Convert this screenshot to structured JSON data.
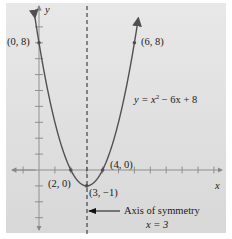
{
  "chart_data": {
    "type": "line",
    "title": "",
    "xlabel": "x",
    "ylabel": "y",
    "equation": "y = x² − 6x + 8",
    "equation_parts": {
      "lhs": "y = x",
      "exp": "2",
      "rhs": " − 6x + 8"
    },
    "x": [
      -0.2,
      0,
      1,
      2,
      3,
      4,
      5,
      6,
      6.2
    ],
    "series": [
      {
        "name": "y = x^2 - 6x + 8",
        "values": [
          9.24,
          8,
          3,
          0,
          -1,
          0,
          3,
          8,
          9.24
        ]
      }
    ],
    "points": [
      {
        "label": "(0, 8)",
        "x": 0,
        "y": 8
      },
      {
        "label": "(6, 8)",
        "x": 6,
        "y": 8
      },
      {
        "label": "(2, 0)",
        "x": 2,
        "y": 0
      },
      {
        "label": "(4, 0)",
        "x": 4,
        "y": 0
      },
      {
        "label": "(3, −1)",
        "x": 3,
        "y": -1
      }
    ],
    "axis_of_symmetry": {
      "x": 3,
      "label_line1": "Axis of symmetry",
      "label_line2": "x = 3"
    },
    "xlim": [
      -2,
      11
    ],
    "ylim": [
      -4,
      10
    ],
    "x_ticks": [
      -1,
      1,
      2,
      3,
      4,
      5,
      6,
      7,
      8,
      9,
      10,
      11
    ],
    "y_ticks": [
      -3,
      -2,
      -1,
      1,
      2,
      3,
      4,
      5,
      6,
      7,
      8,
      9
    ],
    "grid": false,
    "colors": {
      "curve": "#505050",
      "axis": "#7a7a7a",
      "panel": "#dcdcdc",
      "text": "#1a1a1a"
    }
  },
  "labels": {
    "y_axis": "y",
    "x_axis": "x",
    "p08": "(0, 8)",
    "p68": "(6, 8)",
    "p20": "(2, 0)",
    "p40": "(4, 0)",
    "p3m1": "(3, −1)",
    "eq_lhs": "y = x",
    "eq_exp": "2",
    "eq_rhs": " − 6x + 8",
    "axis_line1": "Axis of symmetry",
    "axis_line2": "x = 3"
  }
}
